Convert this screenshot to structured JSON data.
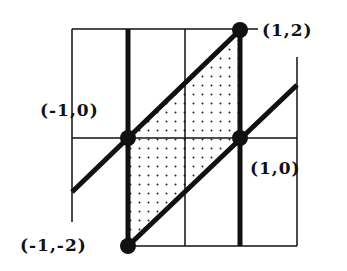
{
  "diagram": {
    "type": "parallelogram region on grid",
    "points": [
      {
        "id": "p1",
        "label": "(1,2)",
        "x": 1,
        "y": 2
      },
      {
        "id": "p2",
        "label": "(-1,0)",
        "x": -1,
        "y": 0
      },
      {
        "id": "p3",
        "label": "(1,0)",
        "x": 1,
        "y": 0
      },
      {
        "id": "p4",
        "label": "(-1,-2)",
        "x": -1,
        "y": -2
      }
    ],
    "lines": [
      "y = x + 1",
      "y = x - 1",
      "x = -1",
      "x = 1"
    ],
    "shaded_region": "parallelogram with vertices (-1,-2), (-1,0), (1,2), (1,0)",
    "colors": {
      "ink": "#111111",
      "background": "#ffffff"
    }
  }
}
